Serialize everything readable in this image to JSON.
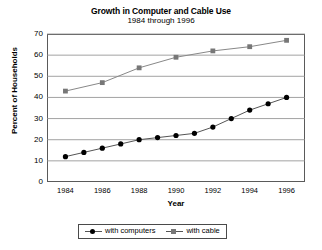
{
  "chart_data": {
    "type": "line",
    "title": "Growth in Computer and Cable Use",
    "subtitle": "1984 through 1996",
    "xlabel": "Year",
    "ylabel": "Percent of Households",
    "xlim": [
      1983,
      1997
    ],
    "ylim": [
      0,
      70
    ],
    "ytick_step": 10,
    "yticks": [
      "0",
      "10",
      "20",
      "30",
      "40",
      "50",
      "60",
      "70"
    ],
    "xticks": [
      "1984",
      "1986",
      "1988",
      "1990",
      "1992",
      "1994",
      "1996"
    ],
    "grid": "horizontal",
    "legend_position": "bottom-center",
    "series": [
      {
        "name": "with computers",
        "marker": "circle",
        "color": "#000000",
        "line_color": "#555555",
        "x": [
          1984,
          1985,
          1986,
          1987,
          1988,
          1989,
          1990,
          1991,
          1992,
          1993,
          1994,
          1995,
          1996
        ],
        "values": [
          12,
          14,
          16,
          18,
          20,
          21,
          22,
          23,
          26,
          30,
          34,
          37,
          40
        ]
      },
      {
        "name": "with cable",
        "marker": "square",
        "color": "#777777",
        "line_color": "#888888",
        "x": [
          1984,
          1986,
          1988,
          1990,
          1992,
          1994,
          1996
        ],
        "values": [
          43,
          47,
          54,
          59,
          62,
          64,
          67
        ]
      }
    ]
  },
  "legend": {
    "items": [
      {
        "label": "with computers"
      },
      {
        "label": "with cable"
      }
    ]
  }
}
